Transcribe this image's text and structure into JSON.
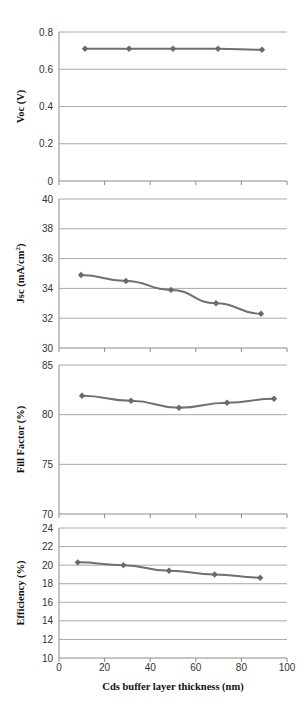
{
  "chart_data": [
    {
      "type": "line",
      "id": "voc",
      "title": "",
      "xlabel": "",
      "ylabel": "Voc (V)",
      "x": [
        10,
        30,
        50,
        70,
        90
      ],
      "series": [
        {
          "name": "Voc",
          "values": [
            0.71,
            0.71,
            0.71,
            0.71,
            0.705
          ]
        }
      ],
      "ylim": [
        0,
        0.8
      ],
      "yticks": [
        "0",
        "0.2",
        "0.4",
        "0.6",
        "0.8"
      ],
      "grid": true,
      "marker": "diamond"
    },
    {
      "type": "line",
      "id": "jsc",
      "title": "",
      "xlabel": "",
      "ylabel": "Jsc (mA/cm2)",
      "x": [
        10,
        30,
        50,
        70,
        90
      ],
      "series": [
        {
          "name": "Jsc",
          "values": [
            34.9,
            34.5,
            33.9,
            33.0,
            32.3
          ]
        }
      ],
      "ylim": [
        30,
        40
      ],
      "yticks": [
        "30",
        "32",
        "34",
        "36",
        "38",
        "40"
      ],
      "grid": true,
      "marker": "diamond"
    },
    {
      "type": "line",
      "id": "ff",
      "title": "",
      "xlabel": "",
      "ylabel": "Fill Factor (%)",
      "x": [
        10,
        30,
        50,
        70,
        90
      ],
      "series": [
        {
          "name": "Fill Factor",
          "values": [
            81.9,
            81.4,
            80.7,
            81.2,
            81.6
          ]
        }
      ],
      "ylim": [
        70,
        85
      ],
      "yticks": [
        "70",
        "75",
        "80",
        "85"
      ],
      "grid": true,
      "marker": "diamond"
    },
    {
      "type": "line",
      "id": "eff",
      "title": "",
      "xlabel": "Cds buffer layer thickness (nm)",
      "ylabel": "Efficiency (%)",
      "x": [
        10,
        30,
        50,
        70,
        90
      ],
      "series": [
        {
          "name": "Efficiency",
          "values": [
            20.3,
            20.0,
            19.4,
            19.0,
            18.65
          ]
        }
      ],
      "ylim": [
        10,
        24
      ],
      "xlim": [
        0,
        100
      ],
      "yticks": [
        "10",
        "12",
        "14",
        "16",
        "18",
        "20",
        "22",
        "24"
      ],
      "xticks": [
        "0",
        "20",
        "40",
        "60",
        "80",
        "100"
      ],
      "grid": true,
      "marker": "diamond"
    }
  ],
  "colors": {
    "line": "#707070",
    "marker": "#6a6a6a",
    "grid": "#a8a8a8",
    "axis": "#8a8a8a"
  }
}
